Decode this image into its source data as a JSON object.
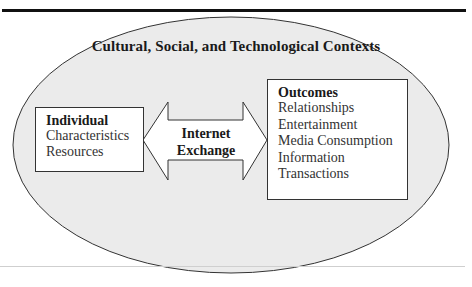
{
  "diagram": {
    "context_title": "Cultural, Social, and Technological Contexts",
    "individual": {
      "heading": "Individual",
      "items": [
        "Characteristics",
        "Resources"
      ]
    },
    "exchange": {
      "line1": "Internet",
      "line2": "Exchange"
    },
    "outcomes": {
      "heading": "Outcomes",
      "items": [
        "Relationships",
        "Entertainment",
        "Media Consumption",
        "Information",
        "Transactions"
      ]
    }
  },
  "colors": {
    "ellipse_fill": "#ebebeb",
    "stroke": "#333333",
    "box_fill": "#ffffff"
  }
}
